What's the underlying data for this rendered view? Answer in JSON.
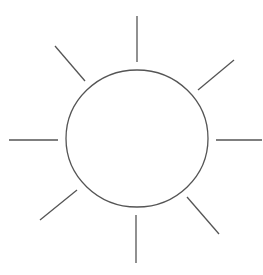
{
  "diagram": {
    "stroke_color": "#555555",
    "background": "#ffffff",
    "circle": {
      "cx": 137,
      "cy": 138.5,
      "rx": 71,
      "ry": 68.5
    },
    "rays": [
      {
        "name": "top",
        "x1": 137,
        "y1": 16,
        "x2": 137,
        "y2": 62
      },
      {
        "name": "top-right",
        "x1": 234,
        "y1": 60,
        "x2": 198,
        "y2": 90
      },
      {
        "name": "right",
        "x1": 216,
        "y1": 140,
        "x2": 262,
        "y2": 140
      },
      {
        "name": "bottom-right",
        "x1": 187,
        "y1": 197,
        "x2": 219,
        "y2": 234
      },
      {
        "name": "bottom",
        "x1": 136,
        "y1": 215,
        "x2": 136,
        "y2": 263
      },
      {
        "name": "bottom-left",
        "x1": 77,
        "y1": 190,
        "x2": 40,
        "y2": 220
      },
      {
        "name": "left",
        "x1": 9,
        "y1": 140,
        "x2": 58,
        "y2": 140
      },
      {
        "name": "top-left",
        "x1": 55,
        "y1": 46,
        "x2": 85,
        "y2": 81
      }
    ]
  }
}
